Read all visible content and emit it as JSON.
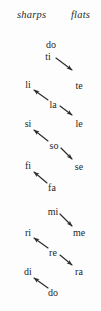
{
  "background_color": "#fdfdfd",
  "text_color": "#2b2b2b",
  "header": {
    "sharps_label": "sharps",
    "flats_label": "flats"
  },
  "columns": {
    "sharps_x": 28,
    "natural_x": 51,
    "flats_x": 78
  },
  "notes": [
    {
      "label": "do",
      "column": "natural",
      "x": 51,
      "y": 45
    },
    {
      "label": "ti",
      "column": "natural",
      "x": 48,
      "y": 57
    },
    {
      "label": "li",
      "column": "sharps",
      "x": 28,
      "y": 85
    },
    {
      "label": "te",
      "column": "flats",
      "x": 79,
      "y": 86
    },
    {
      "label": "la",
      "column": "natural",
      "x": 53,
      "y": 105
    },
    {
      "label": "si",
      "column": "sharps",
      "x": 28,
      "y": 124
    },
    {
      "label": "le",
      "column": "flats",
      "x": 79,
      "y": 124
    },
    {
      "label": "so",
      "column": "natural",
      "x": 54,
      "y": 146
    },
    {
      "label": "fi",
      "column": "sharps",
      "x": 28,
      "y": 166
    },
    {
      "label": "se",
      "column": "flats",
      "x": 79,
      "y": 167
    },
    {
      "label": "fa",
      "column": "natural",
      "x": 52,
      "y": 188
    },
    {
      "label": "mi",
      "column": "natural",
      "x": 53,
      "y": 212
    },
    {
      "label": "ri",
      "column": "sharps",
      "x": 28,
      "y": 233
    },
    {
      "label": "me",
      "column": "flats",
      "x": 79,
      "y": 233
    },
    {
      "label": "re",
      "column": "natural",
      "x": 53,
      "y": 253
    },
    {
      "label": "di",
      "column": "sharps",
      "x": 28,
      "y": 272
    },
    {
      "label": "ra",
      "column": "flats",
      "x": 79,
      "y": 272
    },
    {
      "label": "do",
      "column": "natural",
      "x": 53,
      "y": 293
    }
  ],
  "arrows": [
    {
      "from": "ti",
      "to": "te",
      "x1": 56,
      "y1": 58,
      "x2": 72,
      "y2": 70,
      "direction": "down-right"
    },
    {
      "from": "la",
      "to": "li",
      "x1": 48,
      "y1": 100,
      "x2": 34,
      "y2": 90,
      "direction": "up-left"
    },
    {
      "from": "la",
      "to": "le",
      "x1": 60,
      "y1": 106,
      "x2": 72,
      "y2": 115,
      "direction": "down-right"
    },
    {
      "from": "so",
      "to": "si",
      "x1": 48,
      "y1": 141,
      "x2": 34,
      "y2": 130,
      "direction": "up-left"
    },
    {
      "from": "so",
      "to": "se",
      "x1": 61,
      "y1": 148,
      "x2": 72,
      "y2": 159,
      "direction": "down-right"
    },
    {
      "from": "fa",
      "to": "fi",
      "x1": 47,
      "y1": 183,
      "x2": 34,
      "y2": 172,
      "direction": "up-left"
    },
    {
      "from": "mi",
      "to": "me",
      "x1": 60,
      "y1": 214,
      "x2": 72,
      "y2": 226,
      "direction": "down-right"
    },
    {
      "from": "re",
      "to": "ri",
      "x1": 48,
      "y1": 248,
      "x2": 34,
      "y2": 238,
      "direction": "up-left"
    },
    {
      "from": "re",
      "to": "ra",
      "x1": 60,
      "y1": 255,
      "x2": 72,
      "y2": 265,
      "direction": "down-right"
    },
    {
      "from": "do",
      "to": "di",
      "x1": 48,
      "y1": 288,
      "x2": 34,
      "y2": 278,
      "direction": "up-left"
    }
  ]
}
